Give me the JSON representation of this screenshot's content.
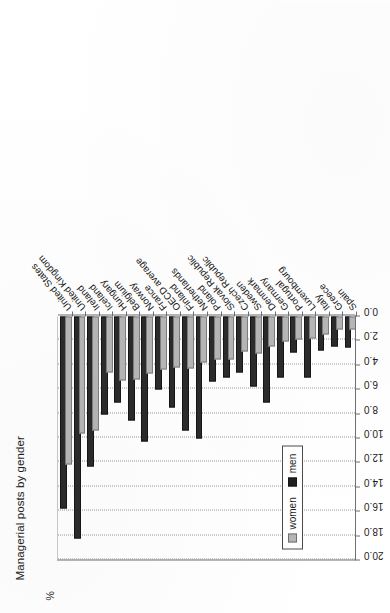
{
  "chart_data": {
    "type": "bar",
    "orientation": "horizontal",
    "title": "Managerial posts by gender",
    "ylabel": "%",
    "xlabel": "",
    "axis_unit_label": "%",
    "xlim": [
      0.0,
      20.0
    ],
    "axis_reversed": true,
    "grid": true,
    "legend_position": "inside-left",
    "tick_labels": [
      "20.0",
      "18.0",
      "16.0",
      "14.0",
      "12.0",
      "10.0",
      "8.0",
      "6.0",
      "4.0",
      "2.0",
      "0.0"
    ],
    "tick_values": [
      20.0,
      18.0,
      16.0,
      14.0,
      12.0,
      10.0,
      8.0,
      6.0,
      4.0,
      2.0,
      0.0
    ],
    "categories": [
      "United States",
      "United Kingdom",
      "Ireland",
      "Iceland",
      "Hungary",
      "Belgium",
      "Norway",
      "France",
      "OECD average",
      "Finland",
      "Netherlands",
      "Poland",
      "Slovak Republic",
      "Czech Republic",
      "Sweden",
      "Denmark",
      "Germany",
      "Portugal",
      "Luxembourg",
      "Italy",
      "Greece",
      "Spain"
    ],
    "series": [
      {
        "name": "women",
        "color": "#b6b6b6",
        "values": [
          12.0,
          9.4,
          9.2,
          4.4,
          5.1,
          5.0,
          4.5,
          4.2,
          4.0,
          4.1,
          3.6,
          3.4,
          3.4,
          2.7,
          2.9,
          2.3,
          1.9,
          1.7,
          1.6,
          1.3,
          0.9,
          0.9
        ]
      },
      {
        "name": "men",
        "color": "#2b2b2b",
        "values": [
          15.6,
          18.0,
          12.1,
          7.9,
          6.9,
          8.4,
          10.1,
          5.8,
          7.3,
          9.2,
          9.8,
          5.2,
          4.8,
          4.4,
          5.6,
          6.9,
          4.8,
          2.8,
          4.8,
          2.6,
          2.3,
          2.4
        ]
      }
    ],
    "legend": [
      {
        "label": "women",
        "color": "#b6b6b6"
      },
      {
        "label": "men",
        "color": "#2b2b2b"
      }
    ]
  }
}
